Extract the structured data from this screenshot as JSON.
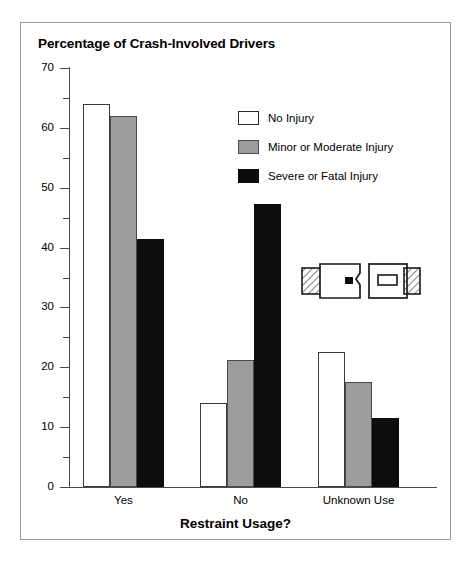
{
  "chart_data": {
    "type": "bar",
    "title": "Percentage of Crash-Involved Drivers",
    "xlabel": "Restraint Usage?",
    "ylabel": "",
    "categories": [
      "Yes",
      "No",
      "Unknown Use"
    ],
    "series": [
      {
        "name": "No Injury",
        "color": "#ffffff",
        "values": [
          64.0,
          14.0,
          22.5
        ]
      },
      {
        "name": "Minor or Moderate Injury",
        "color": "#9d9d9d",
        "values": [
          62.0,
          21.3,
          17.5
        ]
      },
      {
        "name": "Severe or Fatal Injury",
        "color": "#0d0d0d",
        "values": [
          41.5,
          47.2,
          11.5
        ]
      }
    ],
    "ylim": [
      0,
      70
    ],
    "y_major_ticks": [
      0,
      10,
      20,
      30,
      40,
      50,
      60,
      70
    ],
    "y_minor_ticks": [
      5,
      15,
      25,
      35,
      45,
      55,
      65
    ],
    "y_tick_labels": [
      "0",
      "10",
      "20",
      "30",
      "40",
      "50",
      "60",
      "70"
    ],
    "grid": false,
    "legend_position": "upper-right-inside"
  },
  "legend": {
    "items": [
      {
        "label": "No Injury",
        "swatch": "white"
      },
      {
        "label": "Minor or Moderate Injury",
        "swatch": "gray"
      },
      {
        "label": "Severe or Fatal Injury",
        "swatch": "black"
      }
    ]
  },
  "icons": {
    "seatbelt_buckle": "seatbelt-buckle-icon"
  }
}
